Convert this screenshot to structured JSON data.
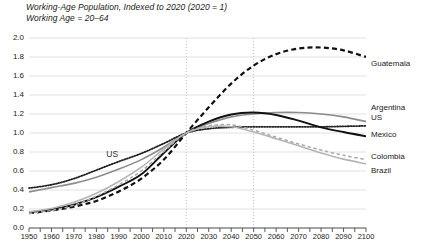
{
  "chart_data": {
    "type": "line",
    "title": "Working-Age Population, Indexed to 2020 (2020 = 1)",
    "subtitle": "Working Age = 20–64",
    "xlabel": "",
    "ylabel": "",
    "xlim": [
      1950,
      2100
    ],
    "ylim": [
      0.0,
      2.0
    ],
    "grid": "horizontal-major-and-vertical-at-2020-2050",
    "legend_position": "right-inline",
    "y_ticks": [
      "0.0",
      "0.2",
      "0.4",
      "0.6",
      "0.8",
      "1.0",
      "1.2",
      "1.4",
      "1.6",
      "1.8",
      "2.0"
    ],
    "y_tick_values": [
      0.0,
      0.2,
      0.4,
      0.6,
      0.8,
      1.0,
      1.2,
      1.4,
      1.6,
      1.8,
      2.0
    ],
    "x_ticks": [
      "1950",
      "1960",
      "1970",
      "1980",
      "1990",
      "2000",
      "2010",
      "2020",
      "2030",
      "2040",
      "2050",
      "2060",
      "2070",
      "2080",
      "2090",
      "2100"
    ],
    "x_tick_values": [
      1950,
      1960,
      1970,
      1980,
      1990,
      2000,
      2010,
      2020,
      2030,
      2040,
      2050,
      2060,
      2070,
      2080,
      2090,
      2100
    ],
    "x": [
      1950,
      1960,
      1970,
      1980,
      1990,
      2000,
      2010,
      2020,
      2030,
      2040,
      2050,
      2060,
      2070,
      2080,
      2090,
      2100
    ],
    "vertical_gridlines": [
      2020,
      2050
    ],
    "annotations": [
      {
        "text": "US",
        "x": 1988,
        "y": 0.78
      }
    ],
    "series": [
      {
        "name": "Guatemala",
        "style": "dashed",
        "color": "#111111",
        "width": 2.2,
        "values": [
          0.155,
          0.185,
          0.225,
          0.285,
          0.385,
          0.52,
          0.72,
          1.0,
          1.27,
          1.52,
          1.71,
          1.83,
          1.89,
          1.9,
          1.87,
          1.8
        ]
      },
      {
        "name": "Argentina",
        "style": "solid",
        "color": "#8c8c8c",
        "width": 1.6,
        "values": [
          0.38,
          0.425,
          0.47,
          0.535,
          0.62,
          0.72,
          0.85,
          1.0,
          1.1,
          1.17,
          1.2,
          1.215,
          1.215,
          1.2,
          1.17,
          1.12
        ]
      },
      {
        "name": "US",
        "style": "dotted",
        "color": "#222222",
        "width": 1.8,
        "values": [
          0.42,
          0.455,
          0.52,
          0.61,
          0.7,
          0.785,
          0.89,
          1.0,
          1.045,
          1.06,
          1.065,
          1.065,
          1.065,
          1.065,
          1.07,
          1.075
        ]
      },
      {
        "name": "Mexico",
        "style": "solid",
        "color": "#111111",
        "width": 1.9,
        "values": [
          0.165,
          0.195,
          0.245,
          0.325,
          0.435,
          0.565,
          0.79,
          1.0,
          1.12,
          1.195,
          1.215,
          1.19,
          1.13,
          1.06,
          1.01,
          0.965
        ]
      },
      {
        "name": "Colombia",
        "style": "dashed-light",
        "color": "#aaaaaa",
        "width": 1.5,
        "values": [
          0.155,
          0.185,
          0.24,
          0.335,
          0.455,
          0.6,
          0.805,
          1.0,
          1.075,
          1.085,
          1.03,
          0.955,
          0.885,
          0.82,
          0.765,
          0.72
        ]
      },
      {
        "name": "Brazil",
        "style": "solid",
        "color": "#b5b5b5",
        "width": 1.6,
        "values": [
          0.17,
          0.205,
          0.27,
          0.365,
          0.49,
          0.64,
          0.83,
          1.0,
          1.065,
          1.065,
          1.01,
          0.94,
          0.865,
          0.79,
          0.725,
          0.675
        ]
      }
    ]
  },
  "labels": {
    "guatemala": "Guatemala",
    "argentina": "Argentina",
    "us": "US",
    "mexico": "Mexico",
    "colombia": "Colombia",
    "brazil": "Brazil",
    "inline_us": "US"
  }
}
